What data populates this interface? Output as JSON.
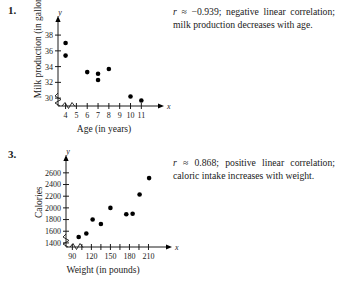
{
  "page": {
    "kind": "answer-key-scatterplots"
  },
  "problems": [
    {
      "number": "1.",
      "answer_text": "r ≈ −0.939; negative linear correlation; milk production decreases with age.",
      "chart_data": {
        "type": "scatter",
        "title": "",
        "xlabel": "Age (in years)",
        "ylabel": "Milk production (in gallons)",
        "x_axis_var": "x",
        "y_axis_var": "y",
        "xlim": [
          3.3,
          11.8
        ],
        "ylim": [
          29.0,
          38.9
        ],
        "xticks": [
          4,
          5,
          6,
          7,
          8,
          9,
          10,
          11
        ],
        "xtick_labels": [
          "4",
          "5",
          "6",
          "7",
          "8",
          "9",
          "10",
          "11"
        ],
        "yticks": [
          30,
          32,
          34,
          36,
          38
        ],
        "ytick_labels": [
          "30",
          "32",
          "34",
          "36",
          "38"
        ],
        "grid": false,
        "axis_break_x": true,
        "axis_break_y": true,
        "legend": "none",
        "points": [
          {
            "x": 4,
            "y": 37.0
          },
          {
            "x": 4,
            "y": 35.4
          },
          {
            "x": 6,
            "y": 33.3
          },
          {
            "x": 7,
            "y": 33.1
          },
          {
            "x": 7,
            "y": 32.3
          },
          {
            "x": 8,
            "y": 33.7
          },
          {
            "x": 10,
            "y": 30.2
          },
          {
            "x": 11,
            "y": 29.7
          }
        ],
        "r": -0.939
      }
    },
    {
      "number": "3.",
      "answer_text": "r ≈ 0.868; positive linear correlation; caloric intake increases with weight.",
      "chart_data": {
        "type": "scatter",
        "title": "",
        "xlabel": "Weight (in pounds)",
        "ylabel": "Calories",
        "x_axis_var": "x",
        "y_axis_var": "y",
        "xlim": [
          80,
          225
        ],
        "ylim": [
          1330,
          2700
        ],
        "xticks": [
          90,
          105,
          120,
          135,
          150,
          165,
          180,
          195,
          210
        ],
        "xtick_labels": [
          "90",
          "",
          "120",
          "",
          "150",
          "",
          "180",
          "",
          "210"
        ],
        "yticks": [
          1400,
          1600,
          1800,
          2000,
          2200,
          2400,
          2600
        ],
        "ytick_labels": [
          "1400",
          "1600",
          "1800",
          "2000",
          "2200",
          "2400",
          "2600"
        ],
        "grid": false,
        "axis_break_x": true,
        "axis_break_y": true,
        "legend": "none",
        "points": [
          {
            "x": 100,
            "y": 1500
          },
          {
            "x": 112,
            "y": 1560
          },
          {
            "x": 122,
            "y": 1800
          },
          {
            "x": 135,
            "y": 1725
          },
          {
            "x": 150,
            "y": 2000
          },
          {
            "x": 175,
            "y": 1890
          },
          {
            "x": 185,
            "y": 1900
          },
          {
            "x": 196,
            "y": 2230
          },
          {
            "x": 211,
            "y": 2510
          }
        ],
        "r": 0.868
      }
    }
  ]
}
